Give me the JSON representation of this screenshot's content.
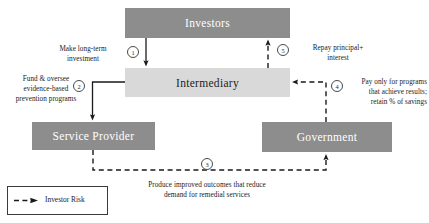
{
  "diagram": {
    "colors": {
      "node_dark": "#8d8d8d",
      "node_light": "#d9d9d9",
      "node_dark_text": "#ffffff",
      "node_light_text": "#1d1d1d",
      "line": "#1a1a1a",
      "background": "#ffffff"
    },
    "nodes": [
      {
        "id": "investors",
        "label": "Investors",
        "style": "dark"
      },
      {
        "id": "intermediary",
        "label": "Intermediary",
        "style": "light"
      },
      {
        "id": "service_provider",
        "label": "Service Provider",
        "style": "dark"
      },
      {
        "id": "government",
        "label": "Government",
        "style": "dark"
      }
    ],
    "steps": [
      {
        "number": "1",
        "label_line1": "Make long-term",
        "label_line2": "investment",
        "from": "investors",
        "to": "intermediary",
        "line_style": "solid"
      },
      {
        "number": "2",
        "label_line1": "Fund & oversee",
        "label_line2": "evidence-based",
        "label_line3": "prevention programs",
        "from": "intermediary",
        "to": "service_provider",
        "line_style": "solid"
      },
      {
        "number": "3",
        "label_line1": "Produce improved outcomes that reduce",
        "label_line2": "demand for remedial services",
        "from": "service_provider",
        "to": "government",
        "line_style": "dashed"
      },
      {
        "number": "4",
        "label_line1": "Pay only for programs",
        "label_line2": "that achieve results;",
        "label_line3": "retain % of savings",
        "from": "government",
        "to": "intermediary",
        "line_style": "dashed"
      },
      {
        "number": "5",
        "label_line1": "Repay principal+",
        "label_line2": "interest",
        "from": "intermediary",
        "to": "investors",
        "line_style": "dashed"
      }
    ],
    "legend": {
      "label": "Investor Risk",
      "line_style": "dashed"
    }
  }
}
